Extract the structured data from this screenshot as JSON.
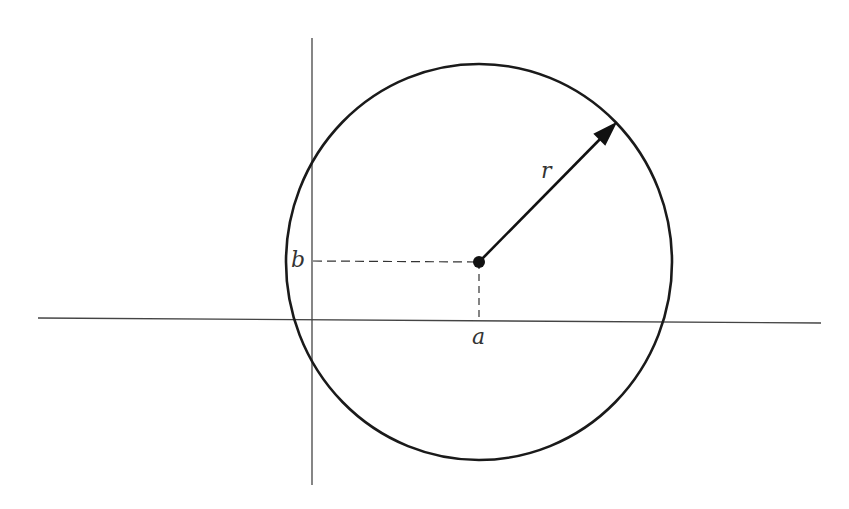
{
  "diagram": {
    "labels": {
      "center_x": "a",
      "center_y": "b",
      "radius": "r"
    },
    "colors": {
      "stroke": "#1a1a1a",
      "axis": "#333333",
      "background": "#ffffff"
    },
    "geometry": {
      "circle_center": [
        479,
        262
      ],
      "circle_radius": 197,
      "x_axis": {
        "from": [
          38,
          318
        ],
        "to": [
          821,
          323
        ]
      },
      "y_axis": {
        "from": [
          312,
          38
        ],
        "to": [
          312,
          485
        ]
      },
      "radius_arrow_end": [
        615,
        124
      ]
    }
  }
}
